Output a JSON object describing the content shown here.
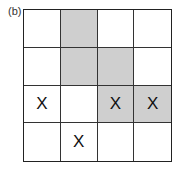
{
  "panel_label": "(b)",
  "grid": {
    "rows": 4,
    "cols": 4,
    "shade_color": "#cfcfcf",
    "cells": [
      [
        {
          "shaded": false,
          "mark": ""
        },
        {
          "shaded": true,
          "mark": ""
        },
        {
          "shaded": false,
          "mark": ""
        },
        {
          "shaded": false,
          "mark": ""
        }
      ],
      [
        {
          "shaded": false,
          "mark": ""
        },
        {
          "shaded": true,
          "mark": ""
        },
        {
          "shaded": true,
          "mark": ""
        },
        {
          "shaded": false,
          "mark": ""
        }
      ],
      [
        {
          "shaded": false,
          "mark": "X"
        },
        {
          "shaded": false,
          "mark": ""
        },
        {
          "shaded": true,
          "mark": "X"
        },
        {
          "shaded": true,
          "mark": "X"
        }
      ],
      [
        {
          "shaded": false,
          "mark": ""
        },
        {
          "shaded": false,
          "mark": "X"
        },
        {
          "shaded": false,
          "mark": ""
        },
        {
          "shaded": false,
          "mark": ""
        }
      ]
    ]
  }
}
